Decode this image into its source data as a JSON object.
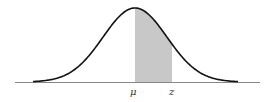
{
  "diagram": {
    "type": "normal-distribution",
    "labels": {
      "mean": "μ",
      "z": "z"
    },
    "colors": {
      "curve": "#111111",
      "shade": "#c8c8c8",
      "axis": "#888888"
    },
    "shaded_region": {
      "from": "μ",
      "to": "z"
    }
  }
}
